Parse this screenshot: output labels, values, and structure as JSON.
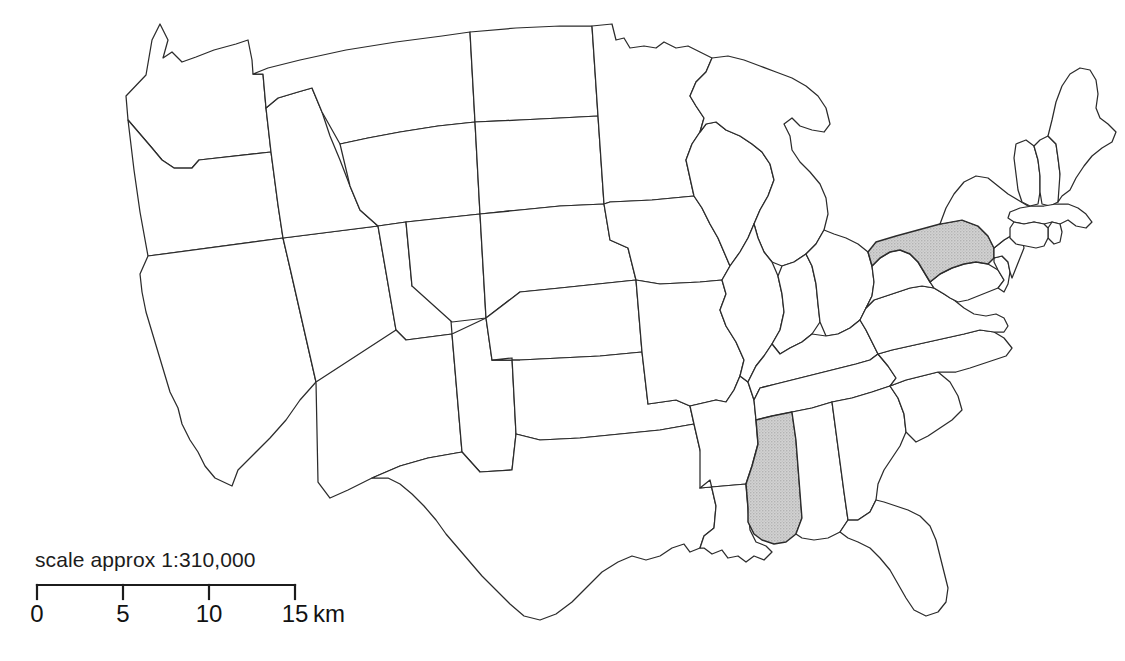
{
  "figure": {
    "kind": "map",
    "background_color": "#ffffff",
    "outline_color": "#2b2b2b",
    "highlight_fill_color": "#c8c8c8"
  },
  "scale": {
    "caption": "scale approx 1:310,000",
    "ticks": [
      "0",
      "5",
      "10",
      "15"
    ],
    "unit": "km",
    "tick_values": [
      0,
      5,
      10,
      15
    ],
    "bar_start_px": 37,
    "bar_end_px": 295
  },
  "highlighted_states": [
    {
      "code": "PA",
      "name": "Pennsylvania"
    },
    {
      "code": "MS",
      "name": "Mississippi"
    }
  ],
  "states": [
    {
      "code": "WA",
      "name": "Washington",
      "highlighted": false
    },
    {
      "code": "OR",
      "name": "Oregon",
      "highlighted": false
    },
    {
      "code": "CA",
      "name": "California",
      "highlighted": false
    },
    {
      "code": "NV",
      "name": "Nevada",
      "highlighted": false
    },
    {
      "code": "ID",
      "name": "Idaho",
      "highlighted": false
    },
    {
      "code": "MT",
      "name": "Montana",
      "highlighted": false
    },
    {
      "code": "WY",
      "name": "Wyoming",
      "highlighted": false
    },
    {
      "code": "UT",
      "name": "Utah",
      "highlighted": false
    },
    {
      "code": "AZ",
      "name": "Arizona",
      "highlighted": false
    },
    {
      "code": "CO",
      "name": "Colorado",
      "highlighted": false
    },
    {
      "code": "NM",
      "name": "New Mexico",
      "highlighted": false
    },
    {
      "code": "ND",
      "name": "North Dakota",
      "highlighted": false
    },
    {
      "code": "SD",
      "name": "South Dakota",
      "highlighted": false
    },
    {
      "code": "NE",
      "name": "Nebraska",
      "highlighted": false
    },
    {
      "code": "KS",
      "name": "Kansas",
      "highlighted": false
    },
    {
      "code": "OK",
      "name": "Oklahoma",
      "highlighted": false
    },
    {
      "code": "TX",
      "name": "Texas",
      "highlighted": false
    },
    {
      "code": "MN",
      "name": "Minnesota",
      "highlighted": false
    },
    {
      "code": "IA",
      "name": "Iowa",
      "highlighted": false
    },
    {
      "code": "MO",
      "name": "Missouri",
      "highlighted": false
    },
    {
      "code": "AR",
      "name": "Arkansas",
      "highlighted": false
    },
    {
      "code": "LA",
      "name": "Louisiana",
      "highlighted": false
    },
    {
      "code": "WI",
      "name": "Wisconsin",
      "highlighted": false
    },
    {
      "code": "IL",
      "name": "Illinois",
      "highlighted": false
    },
    {
      "code": "MI",
      "name": "Michigan",
      "highlighted": false
    },
    {
      "code": "IN",
      "name": "Indiana",
      "highlighted": false
    },
    {
      "code": "OH",
      "name": "Ohio",
      "highlighted": false
    },
    {
      "code": "KY",
      "name": "Kentucky",
      "highlighted": false
    },
    {
      "code": "TN",
      "name": "Tennessee",
      "highlighted": false
    },
    {
      "code": "MS",
      "name": "Mississippi",
      "highlighted": true
    },
    {
      "code": "AL",
      "name": "Alabama",
      "highlighted": false
    },
    {
      "code": "GA",
      "name": "Georgia",
      "highlighted": false
    },
    {
      "code": "FL",
      "name": "Florida",
      "highlighted": false
    },
    {
      "code": "SC",
      "name": "South Carolina",
      "highlighted": false
    },
    {
      "code": "NC",
      "name": "North Carolina",
      "highlighted": false
    },
    {
      "code": "VA",
      "name": "Virginia",
      "highlighted": false
    },
    {
      "code": "WV",
      "name": "West Virginia",
      "highlighted": false
    },
    {
      "code": "MD",
      "name": "Maryland",
      "highlighted": false
    },
    {
      "code": "DE",
      "name": "Delaware",
      "highlighted": false
    },
    {
      "code": "PA",
      "name": "Pennsylvania",
      "highlighted": true
    },
    {
      "code": "NJ",
      "name": "New Jersey",
      "highlighted": false
    },
    {
      "code": "NY",
      "name": "New York",
      "highlighted": false
    },
    {
      "code": "CT",
      "name": "Connecticut",
      "highlighted": false
    },
    {
      "code": "RI",
      "name": "Rhode Island",
      "highlighted": false
    },
    {
      "code": "MA",
      "name": "Massachusetts",
      "highlighted": false
    },
    {
      "code": "VT",
      "name": "Vermont",
      "highlighted": false
    },
    {
      "code": "NH",
      "name": "New Hampshire",
      "highlighted": false
    },
    {
      "code": "ME",
      "name": "Maine",
      "highlighted": false
    }
  ]
}
